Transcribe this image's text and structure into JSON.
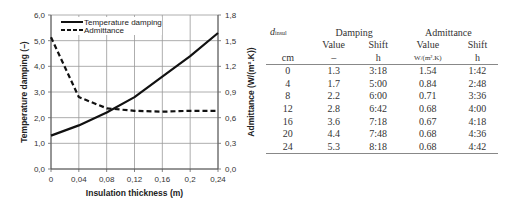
{
  "chart_data": {
    "type": "line",
    "title": "",
    "xlabel": "Insulation thickness (m)",
    "ylabel_left": "Temperature damping (–)",
    "ylabel_right": "Admittance (W/(m².K))",
    "x": [
      0,
      0.04,
      0.08,
      0.12,
      0.16,
      0.2,
      0.24
    ],
    "x_tick_labels": [
      "0",
      "0,04",
      "0,08",
      "0,12",
      "0,16",
      "0,2",
      "0,24"
    ],
    "xlim": [
      0,
      0.24
    ],
    "ylim_left": [
      0,
      6
    ],
    "ylim_right": [
      0,
      1.8
    ],
    "y_left_tick_labels": [
      "0,0",
      "1,0",
      "2,0",
      "3,0",
      "4,0",
      "5,0",
      "6,0"
    ],
    "y_right_tick_labels": [
      "0,0",
      "0,3",
      "0,6",
      "0,9",
      "1,2",
      "1,5",
      "1,8"
    ],
    "grid": true,
    "legend_position": "upper left",
    "series": [
      {
        "name": "Temperature damping",
        "axis": "left",
        "style": "solid",
        "values": [
          1.3,
          1.7,
          2.2,
          2.8,
          3.6,
          4.4,
          5.3
        ]
      },
      {
        "name": "Admittance",
        "axis": "right",
        "style": "dashed",
        "values": [
          1.54,
          0.84,
          0.71,
          0.68,
          0.67,
          0.68,
          0.68
        ]
      }
    ]
  },
  "table": {
    "header": {
      "d_var": "d",
      "d_sub": "insul",
      "damping": "Damping",
      "admittance": "Admittance",
      "value": "Value",
      "shift": "Shift"
    },
    "units": [
      "cm",
      "–",
      "h",
      "W/(m².K)",
      "h"
    ],
    "rows": [
      [
        "0",
        "1.3",
        "3:18",
        "1.54",
        "1:42"
      ],
      [
        "4",
        "1.7",
        "5:00",
        "0.84",
        "2:48"
      ],
      [
        "8",
        "2.2",
        "6:00",
        "0.71",
        "3:36"
      ],
      [
        "12",
        "2.8",
        "6:42",
        "0.68",
        "4:00"
      ],
      [
        "16",
        "3.6",
        "7:18",
        "0.67",
        "4:18"
      ],
      [
        "20",
        "4.4",
        "7:48",
        "0.68",
        "4:36"
      ],
      [
        "24",
        "5.3",
        "8:18",
        "0.68",
        "4:42"
      ]
    ]
  }
}
